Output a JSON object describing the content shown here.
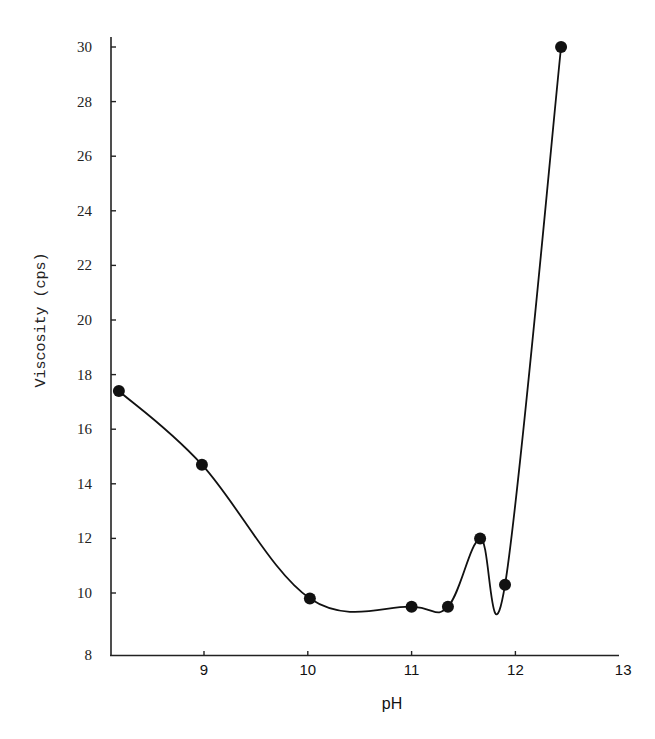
{
  "chart_data": {
    "type": "line",
    "title": "",
    "xlabel": "pH",
    "ylabel": "Viscosity (cps)",
    "xlim": [
      8.1,
      13
    ],
    "ylim": [
      8,
      30
    ],
    "grid": false,
    "legend": null,
    "x_ticks": [
      "9",
      "10",
      "11",
      "12",
      "13"
    ],
    "y_ticks": [
      "8",
      "10",
      "12",
      "14",
      "16",
      "18",
      "20",
      "22",
      "24",
      "26",
      "28",
      "30"
    ],
    "series": [
      {
        "name": "Viscosity vs pH",
        "marker": "filled-circle",
        "line": "smooth",
        "x": [
          8.18,
          8.98,
          10.02,
          11.0,
          11.35,
          11.66,
          11.9,
          12.44
        ],
        "y": [
          17.4,
          14.7,
          9.8,
          9.5,
          9.5,
          12.0,
          10.3,
          30.0
        ]
      }
    ]
  },
  "colors": {
    "line": "#111111",
    "marker": "#111111",
    "axis": "#222222",
    "background": "#ffffff"
  }
}
